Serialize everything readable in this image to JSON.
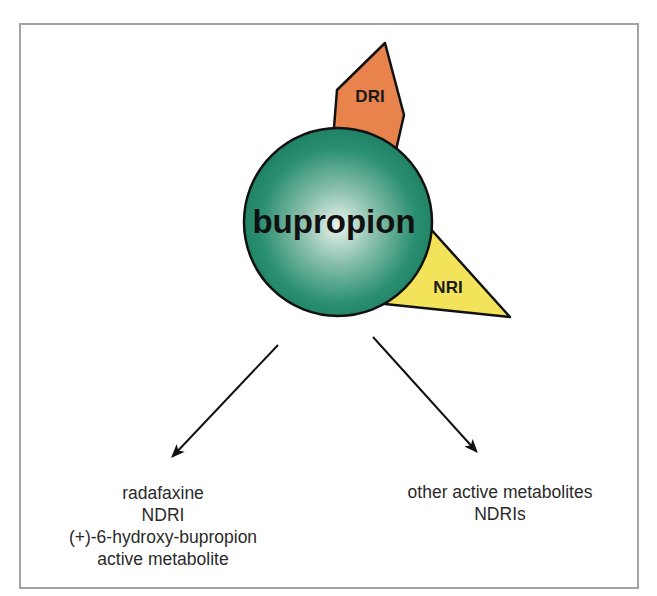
{
  "diagram": {
    "center": {
      "label": "bupropion",
      "color": "#1f8a6b",
      "highlight": "#e6f1ec"
    },
    "attachments": [
      {
        "label": "DRI",
        "shape": "pentagon",
        "color": "#e8834e"
      },
      {
        "label": "NRI",
        "shape": "triangle",
        "color": "#f2e35a"
      }
    ],
    "outputs": [
      {
        "lines": [
          "radafaxine",
          "NDRI",
          "(+)-6-hydroxy-bupropion",
          "active metabolite"
        ],
        "direction": "down-left"
      },
      {
        "lines": [
          "other active metabolites",
          "NDRIs"
        ],
        "direction": "down-right"
      }
    ],
    "stroke_color": "#111111",
    "frame_color": "#a3a3a3"
  }
}
